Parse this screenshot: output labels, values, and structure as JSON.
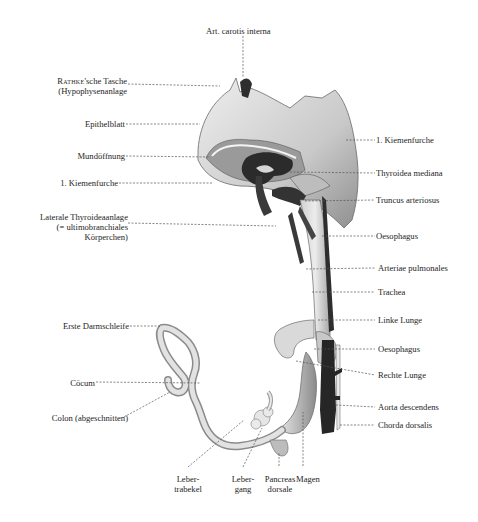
{
  "figure": {
    "type": "anatomical-illustration",
    "labels_left": [
      {
        "id": "rathke",
        "line1_smallcaps": "Rathke",
        "line1_rest": "'sche Tasche",
        "line2": "(Hypophysenanlage"
      },
      {
        "id": "epithelblatt",
        "text": "Epithelblatt"
      },
      {
        "id": "mundoeffnung",
        "text": "Mundöffnung"
      },
      {
        "id": "kiemenfurche-left",
        "text": "1. Kiemenfurche"
      },
      {
        "id": "laterale-thyroidea",
        "line1": "Laterale  Thyroideaanlage",
        "line2": "(= ultimobranchiales",
        "line3": "Körperchen)"
      },
      {
        "id": "erste-darmschleife",
        "text": "Erste Darmschleife"
      },
      {
        "id": "coecum",
        "text": "Cöcum"
      },
      {
        "id": "colon",
        "text": "Colon (abgeschnitten)"
      }
    ],
    "labels_top": [
      {
        "id": "art-carotis",
        "text": "Art. carotis interna"
      }
    ],
    "labels_right": [
      {
        "id": "kiemenfurche-right",
        "text": "1. Kiemenfurche"
      },
      {
        "id": "thyroidea-mediana",
        "text": "Thyroidea mediana"
      },
      {
        "id": "truncus",
        "text": "Truncus arteriosus"
      },
      {
        "id": "oesophagus-1",
        "text": "Oesophagus"
      },
      {
        "id": "arteriae-pulmonales",
        "text": "Arteriae pulmonales"
      },
      {
        "id": "trachea",
        "text": "Trachea"
      },
      {
        "id": "linke-lunge",
        "text": "Linke Lunge"
      },
      {
        "id": "oesophagus-2",
        "text": "Oesophagus"
      },
      {
        "id": "rechte-lunge",
        "text": "Rechte Lunge"
      },
      {
        "id": "aorta-descendens",
        "text": "Aorta descendens"
      },
      {
        "id": "chorda-dorsalis",
        "text": "Chorda dorsalis"
      }
    ],
    "labels_bottom": [
      {
        "id": "leber-trabekel",
        "line1": "Leber-",
        "line2": "trabekel"
      },
      {
        "id": "leber-gang",
        "line1": "Leber-",
        "line2": "gang"
      },
      {
        "id": "pancreas",
        "line1": "Pancreas",
        "line2": "dorsale"
      },
      {
        "id": "magen",
        "text": "Magen"
      }
    ],
    "colors": {
      "background": "#ffffff",
      "tissue_light": "#d8d8d8",
      "tissue_mid": "#a9a9a9",
      "vessel_dark": "#2a2a2a",
      "leader_line": "#555555"
    }
  }
}
